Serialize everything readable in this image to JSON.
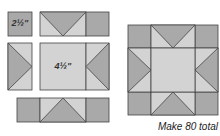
{
  "colors": {
    "dark": "#a9a9a9",
    "light": "#d3d3d3",
    "stroke": "#333333"
  },
  "labels": {
    "small_square": "2½\"",
    "center_square": "4½\""
  },
  "caption": "Make 80 total"
}
